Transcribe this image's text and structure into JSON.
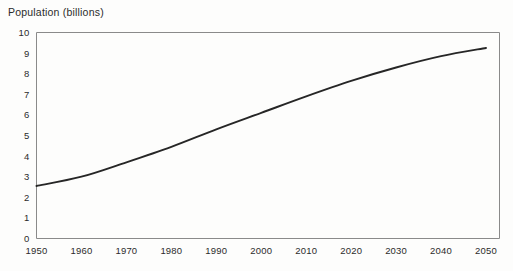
{
  "chart_data": {
    "type": "line",
    "title": "Population (billions)",
    "xlabel": "",
    "ylabel": "",
    "grid": false,
    "legend": false,
    "x": [
      1950,
      1960,
      1970,
      1980,
      1990,
      2000,
      2010,
      2020,
      2030,
      2040,
      2050
    ],
    "categories": [
      "1950",
      "1960",
      "1970",
      "1980",
      "1990",
      "2000",
      "2010",
      "2020",
      "2030",
      "2040",
      "2050"
    ],
    "values": [
      2.55,
      3.0,
      3.7,
      4.45,
      5.3,
      6.1,
      6.9,
      7.65,
      8.3,
      8.85,
      9.25
    ],
    "series": [
      {
        "name": "Population",
        "values": [
          2.55,
          3.0,
          3.7,
          4.45,
          5.3,
          6.1,
          6.9,
          7.65,
          8.3,
          8.85,
          9.25
        ]
      }
    ],
    "xlim": [
      1950,
      2053
    ],
    "ylim": [
      0,
      10
    ],
    "y_ticks": [
      "0",
      "1",
      "2",
      "3",
      "4",
      "5",
      "6",
      "7",
      "8",
      "9",
      "10"
    ],
    "y_tick_values": [
      0,
      1,
      2,
      3,
      4,
      5,
      6,
      7,
      8,
      9,
      10
    ],
    "x_ticks": [
      "1950",
      "1960",
      "1970",
      "1980",
      "1990",
      "2000",
      "2010",
      "2020",
      "2030",
      "2040",
      "2050"
    ],
    "line_color": "#262626",
    "axis_color": "#8a8a8a",
    "background_color": "#fdfdfc",
    "text_color": "#2b2b2b"
  }
}
